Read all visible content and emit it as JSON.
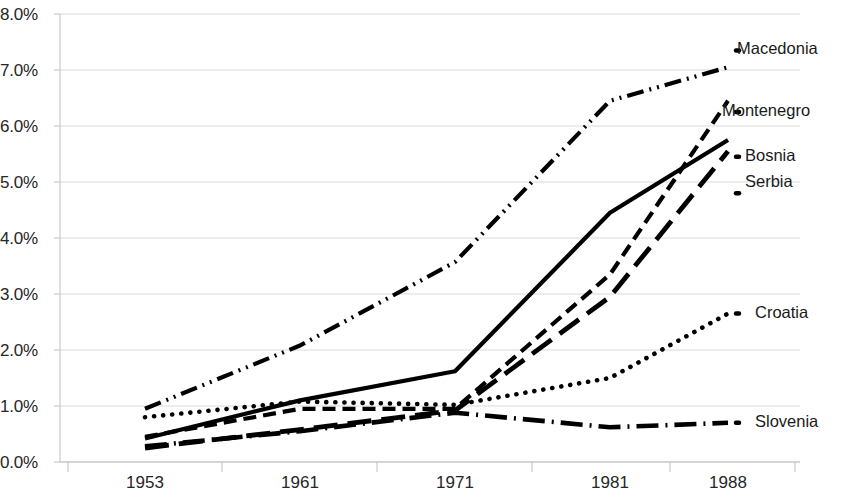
{
  "chart_data": {
    "type": "line",
    "title": "",
    "subtitle": "",
    "xlabel": "",
    "ylabel": "",
    "categories": [
      "1953",
      "1961",
      "1971",
      "1981",
      "1988"
    ],
    "ylim": [
      0.0,
      8.0
    ],
    "ytick_labels": [
      "0.0%",
      "1.0%",
      "2.0%",
      "3.0%",
      "4.0%",
      "5.0%",
      "6.0%",
      "7.0%",
      "8.0%"
    ],
    "ytick_values": [
      0.0,
      1.0,
      2.0,
      3.0,
      4.0,
      5.0,
      6.0,
      7.0,
      8.0
    ],
    "grid": true,
    "grid_axis": "y",
    "legend_position": "right-inline-labels",
    "value_unit": "percent",
    "series": [
      {
        "name": "Macedonia",
        "values": [
          0.95,
          2.08,
          3.57,
          6.45,
          7.05
        ],
        "line_style": "dash-dot-dot",
        "color": "#000000",
        "label_y_percent": 7.35
      },
      {
        "name": "Montenegro",
        "values": [
          0.45,
          0.95,
          0.95,
          3.35,
          6.45
        ],
        "line_style": "dashed",
        "color": "#000000",
        "label_y_percent": 6.25
      },
      {
        "name": "Bosnia",
        "values": [
          0.42,
          1.1,
          1.62,
          4.45,
          5.75
        ],
        "line_style": "solid",
        "color": "#000000",
        "label_y_percent": 5.45
      },
      {
        "name": "Serbia",
        "values": [
          0.25,
          0.58,
          0.92,
          2.95,
          5.55
        ],
        "line_style": "long-dash",
        "color": "#000000",
        "label_y_percent": 4.8
      },
      {
        "name": "Croatia",
        "values": [
          0.8,
          1.08,
          1.02,
          1.5,
          2.65
        ],
        "line_style": "dotted",
        "color": "#000000",
        "label_y_percent": 2.65
      },
      {
        "name": "Slovenia",
        "values": [
          0.28,
          0.55,
          0.88,
          0.62,
          0.7
        ],
        "line_style": "dash-dot",
        "color": "#000000",
        "label_y_percent": 0.7
      }
    ]
  },
  "axis": {
    "x_labels": [
      "1953",
      "1961",
      "1971",
      "1981",
      "1988"
    ],
    "y_labels": [
      "8.0%",
      "7.0%",
      "6.0%",
      "5.0%",
      "4.0%",
      "3.0%",
      "2.0%",
      "1.0%",
      "0.0%"
    ]
  },
  "labels": {
    "macedonia": "Macedonia",
    "montenegro": "Montenegro",
    "bosnia": "Bosnia",
    "serbia": "Serbia",
    "croatia": "Croatia",
    "slovenia": "Slovenia"
  },
  "colors": {
    "line": "#000000",
    "grid": "#d9d9d9",
    "text": "#262626"
  }
}
